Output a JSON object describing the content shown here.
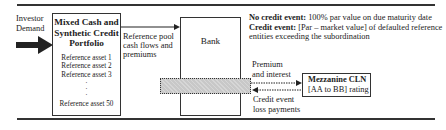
{
  "investor": {
    "label_line1": "Investor",
    "label_line2": "Demand"
  },
  "portfolio": {
    "title_line1": "Mixed Cash and",
    "title_line2": "Synthetic Credit",
    "title_line3": "Portfolio",
    "assets": [
      "Reference asset 1",
      "Reference asset 2",
      "Reference asset 3"
    ],
    "ellipsis": [
      "·",
      "·",
      "·"
    ],
    "last_asset": "Reference asset 50"
  },
  "flow_to_bank": {
    "line1": "Reference pool",
    "line2": "cash flows and",
    "line3": "premiums"
  },
  "bank": {
    "label": "Bank"
  },
  "terms": {
    "no_event_label": "No credit event:",
    "no_event_text": " 100% par value on due maturity date",
    "event_label": "Credit event:",
    "event_text": " [Par – market value] of defaulted reference",
    "event_text2": "entities exceeding the subordination"
  },
  "premium_flow": {
    "line1": "Premium",
    "line2": "and interest"
  },
  "loss_flow": {
    "line1": "Credit event",
    "line2": "loss payments"
  },
  "mezzanine": {
    "line1": "Mezzanine CLN",
    "line2": "[AA to BB] rating"
  }
}
